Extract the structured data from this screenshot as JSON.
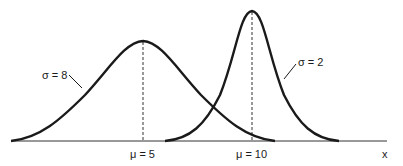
{
  "diagram": {
    "title": "",
    "curves": [
      {
        "name": "wide-normal",
        "label": "σ = 8",
        "mean_label": "μ = 5"
      },
      {
        "name": "narrow-normal",
        "label": "σ = 2",
        "mean_label": "μ = 10"
      }
    ],
    "axis": {
      "x_label": "x"
    },
    "colors": {
      "line": "#1a1a1a",
      "background": "#ffffff"
    }
  }
}
